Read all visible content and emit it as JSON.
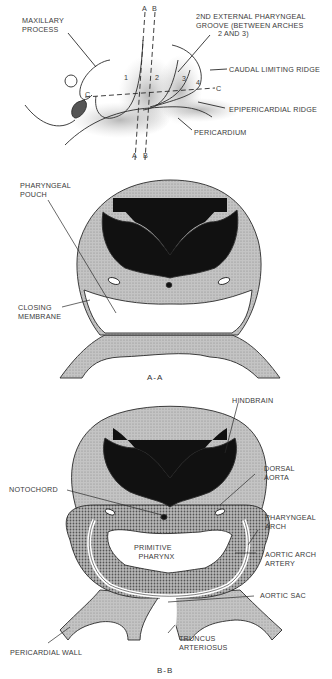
{
  "figure": {
    "panels": [
      {
        "id": "lateral-view",
        "labels": {
          "maxillary_process": "MAXILLARY\nPROCESS",
          "groove": "2ND EXTERNAL PHARYNGEAL\nGROOVE (BETWEEN ARCHES\n          2 AND 3)",
          "caudal_ridge": "CAUDAL LIMITING RIDGE",
          "epipericardial_ridge": "EPIPERICARDIAL RIDGE",
          "pericardium": "PERICARDIUM",
          "section_top_a": "A",
          "section_top_b": "B",
          "section_bottom_a": "A",
          "section_bottom_b": "B",
          "section_c_left": "C",
          "section_c_right": "C",
          "arch_1": "1",
          "arch_2": "2",
          "arch_3": "3",
          "arch_4": "4"
        }
      },
      {
        "id": "section-a-a",
        "caption": "A-A",
        "labels": {
          "pharyngeal_pouch": "PHARYNGEAL\nPOUCH",
          "closing_membrane": "CLOSING\nMEMBRANE"
        }
      },
      {
        "id": "section-b-b",
        "caption": "B-B",
        "labels": {
          "hindbrain": "HINDBRAIN",
          "dorsal_aorta": "DORSAL\nAORTA",
          "notochord": "NOTOCHORD",
          "pharyngeal_arch": "PHARYNGEAL\nARCH",
          "primitive_pharynx": "PRIMITIVE\n  PHARYNX",
          "aortic_arch_artery": "AORTIC ARCH\nARTERY",
          "aortic_sac": "AORTIC SAC",
          "truncus_arteriosus": "TRUNCUS\nARTERIOSUS",
          "pericardial_wall": "PERICARDIAL WALL"
        }
      }
    ],
    "colors": {
      "tissue_gray": "#bdbdbd",
      "neural_black": "#111111",
      "line": "#2a2a2a",
      "arch_dotted": "#9a9a9a"
    }
  }
}
